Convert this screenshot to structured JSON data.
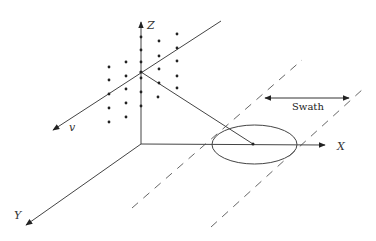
{
  "diagram": {
    "type": "swath-geometry",
    "colors": {
      "line": "#444444",
      "dashed": "#555555",
      "dot": "#222222",
      "background": "#ffffff"
    },
    "axes": {
      "x": {
        "label": "X"
      },
      "y": {
        "label": "Y"
      },
      "z": {
        "label": "Z"
      },
      "velocity": {
        "label": "v"
      }
    },
    "swath": {
      "label": "Swath"
    },
    "footprint": {
      "shape": "ellipse"
    },
    "sensor_grid": {
      "columns": 5,
      "description": "array of sensor points arranged in a tilted plane"
    }
  }
}
